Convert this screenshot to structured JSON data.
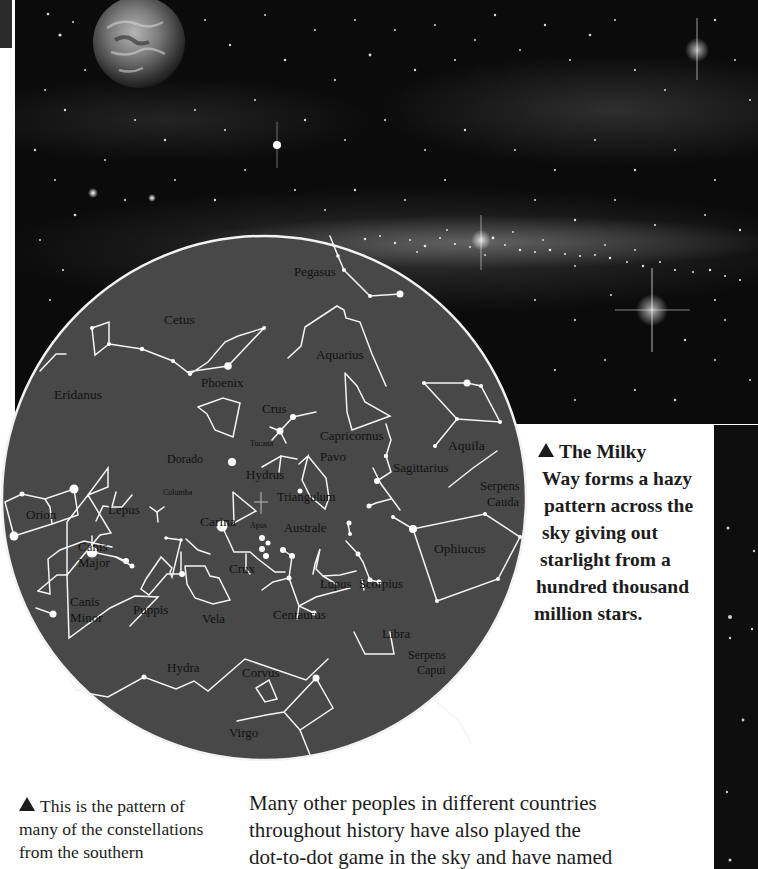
{
  "figure": {
    "sky_photo": {
      "description": "Night sky photograph with planet and Milky Way band",
      "planet_icon": "earth-planet"
    },
    "star_map": {
      "title": "Southern hemisphere constellations",
      "fill_color": "#484848",
      "line_color": "#ffffff",
      "labels": {
        "pegasus": "Pegasus",
        "cetus": "Cetus",
        "aquarius": "Aquarius",
        "phoenix": "Phoenix",
        "eridanus": "Eridanus",
        "crus": "Crus",
        "tucana": "Tucana",
        "capricornus": "Capricornus",
        "aquila": "Aquila",
        "dorado": "Dorado",
        "hydrus": "Hydrus",
        "pavo": "Pavo",
        "sagittarius": "Sagittarius",
        "serpens_cauda_1": "Serpens",
        "serpens_cauda_2": "Cauda",
        "columba": "Columba",
        "triangulum": "Triangulum",
        "orion": "Orion",
        "lepus": "Lepus",
        "carina": "Carina",
        "apus": "Apus",
        "australe": "Australe",
        "canis_major_1": "Canis",
        "canis_major_2": "Major",
        "crux": "Crux",
        "lupus": "Lupus",
        "scorpius": "Scorpius",
        "ophiucus": "Ophiucus",
        "puppis": "Puppis",
        "vela": "Vela",
        "centaurus": "Centaurus",
        "canis_minor_1": "Canis",
        "canis_minor_2": "Minor",
        "libra": "Libra",
        "serpens_capui_1": "Serpens",
        "serpens_capui_2": "Capui",
        "hydra": "Hydra",
        "corvus": "Corvus",
        "virgo": "Virgo"
      }
    }
  },
  "captions": {
    "milky_way": {
      "icon": "triangle-up-icon",
      "lines": [
        "The Milky",
        "Way forms a hazy",
        "pattern across the",
        "sky giving out",
        "starlight from a",
        "hundred thousand",
        "million stars."
      ]
    },
    "star_map": {
      "icon": "triangle-up-icon",
      "lines": [
        "This is the pattern of",
        "many of the constellations",
        "from the southern"
      ]
    }
  },
  "body": {
    "lines": [
      "Many other peoples in different countries",
      "throughout history have also played the",
      "dot-to-dot game in the sky and have named"
    ]
  }
}
